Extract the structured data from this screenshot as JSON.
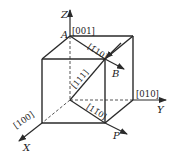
{
  "diagram": {
    "title": "",
    "axes": {
      "x": "X",
      "y": "Y",
      "z": "Z"
    },
    "points": {
      "origin": "O",
      "a": "A",
      "b": "B",
      "p": "P"
    },
    "directions": {
      "d001": "[001]",
      "d010": "[010]",
      "d100": "[100]",
      "d111": "[111]",
      "d110_top": "[1̄10]",
      "d110_bottom": "[11̄0]"
    },
    "colors": {
      "line": "#2a2a2a",
      "background": "#ffffff"
    }
  }
}
